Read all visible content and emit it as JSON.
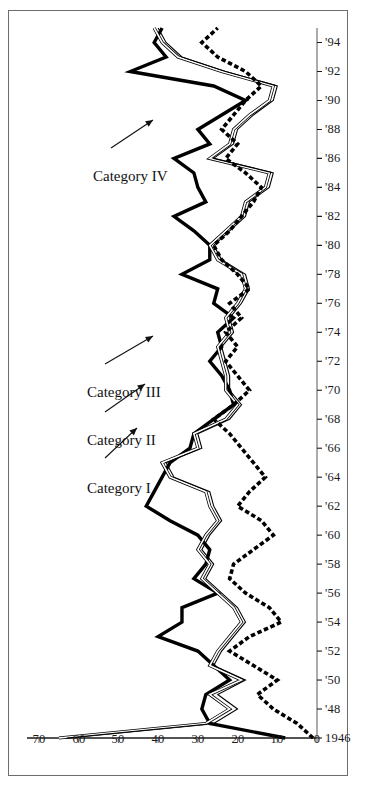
{
  "figure": {
    "orientation": "rotated-90-ccw",
    "background_color": "#ffffff",
    "frame_color": "#6d6d6d",
    "ink_color": "#000000"
  },
  "annotations": [
    {
      "id": "cat1",
      "label": "Category I"
    },
    {
      "id": "cat2",
      "label": "Category II"
    },
    {
      "id": "cat3",
      "label": "Category III"
    },
    {
      "id": "cat4",
      "label": "Category IV"
    }
  ],
  "chart_data": {
    "type": "line",
    "title": "",
    "subtitle": "",
    "xlabel": "",
    "ylabel": "",
    "grid": false,
    "legend_position": "inline-annotations",
    "xlim": [
      1946,
      1995
    ],
    "ylim": [
      0,
      70
    ],
    "ytick_values": [
      0,
      10,
      20,
      30,
      40,
      50,
      60,
      70
    ],
    "ytick_labels": [
      "0",
      "10",
      "20",
      "30",
      "40",
      "50",
      "60",
      "70"
    ],
    "xtick_values": [
      1946,
      1948,
      1950,
      1952,
      1954,
      1956,
      1958,
      1960,
      1962,
      1964,
      1966,
      1968,
      1970,
      1972,
      1974,
      1976,
      1978,
      1980,
      1982,
      1984,
      1986,
      1988,
      1990,
      1992,
      1994
    ],
    "xtick_labels": [
      "1946",
      "'48",
      "'50",
      "'52",
      "'54",
      "'56",
      "'58",
      "'60",
      "'62",
      "'64",
      "'66",
      "'68",
      "'70",
      "'72",
      "'74",
      "'76",
      "'78",
      "'80",
      "'82",
      "'84",
      "'86",
      "'88",
      "'90",
      "'92",
      "'94"
    ],
    "x": [
      1946,
      1947,
      1948,
      1949,
      1950,
      1951,
      1952,
      1953,
      1954,
      1955,
      1956,
      1957,
      1958,
      1959,
      1960,
      1961,
      1962,
      1963,
      1964,
      1965,
      1966,
      1967,
      1968,
      1969,
      1970,
      1971,
      1972,
      1973,
      1974,
      1975,
      1976,
      1977,
      1978,
      1979,
      1980,
      1981,
      1982,
      1983,
      1984,
      1985,
      1986,
      1987,
      1988,
      1989,
      1990,
      1991,
      1992,
      1993,
      1994,
      1995
    ],
    "series": [
      {
        "name": "Category I",
        "style": "thick-solid",
        "line_color": "#000000",
        "values": [
          8,
          27,
          29,
          28,
          22,
          26,
          30,
          40,
          34,
          34,
          25,
          31,
          28,
          27,
          30,
          37,
          43,
          41,
          39,
          37,
          32,
          31,
          26,
          21,
          22,
          24,
          27,
          24,
          25,
          21,
          26,
          25,
          34,
          27,
          27,
          31,
          36,
          28,
          30,
          31,
          36,
          27,
          30,
          24,
          18,
          26,
          47,
          38,
          41,
          39
        ]
      },
      {
        "name": "Category II",
        "style": "thin-outline",
        "line_color": "#000000",
        "values": [
          65,
          28,
          22,
          27,
          19,
          27,
          25,
          22,
          19,
          21,
          25,
          29,
          27,
          30,
          28,
          25,
          27,
          28,
          37,
          39,
          30,
          31,
          23,
          20,
          23,
          23,
          24,
          25,
          22,
          23,
          20,
          18,
          19,
          25,
          27,
          23,
          19,
          18,
          13,
          12,
          27,
          22,
          21,
          17,
          12,
          11,
          24,
          35,
          39,
          41
        ]
      },
      {
        "name": "Category III",
        "style": "thin-solid",
        "line_color": "#000000",
        "values": [
          63,
          26,
          20,
          25,
          18,
          26,
          24,
          21,
          18,
          20,
          24,
          28,
          26,
          29,
          27,
          24,
          26,
          27,
          36,
          38,
          29,
          30,
          22,
          19,
          22,
          22,
          23,
          24,
          21,
          22,
          19,
          17,
          18,
          24,
          26,
          22,
          18,
          17,
          12,
          11,
          26,
          21,
          20,
          16,
          11,
          10,
          23,
          34,
          38,
          40
        ]
      },
      {
        "name": "Category IV",
        "style": "thick-dotted",
        "line_color": "#000000",
        "values": [
          1,
          5,
          11,
          15,
          10,
          16,
          22,
          17,
          9,
          12,
          18,
          22,
          21,
          16,
          11,
          14,
          20,
          17,
          13,
          16,
          19,
          22,
          26,
          21,
          17,
          20,
          23,
          20,
          23,
          19,
          22,
          17,
          20,
          24,
          26,
          22,
          19,
          16,
          14,
          18,
          23,
          20,
          24,
          21,
          18,
          14,
          18,
          25,
          29,
          25
        ]
      }
    ]
  }
}
